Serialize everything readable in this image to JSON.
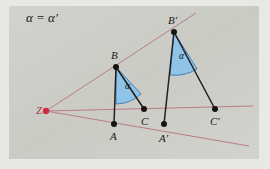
{
  "figure": {
    "title": "α = α′",
    "background_color": "#cdcdc8",
    "frame_color": "#e8e8e4",
    "ray_color": "#b5737d",
    "segment_color": "#1f1f1d",
    "angle_fill_color": "#8fc4e8",
    "angle_stroke_color": "#2f6fa8",
    "center_color": "#d42b3c",
    "vertex_color": "#141412"
  },
  "points": {
    "Z": {
      "label": "Z",
      "x": 46,
      "y": 111
    },
    "A": {
      "label": "A",
      "x": 114,
      "y": 124
    },
    "B": {
      "label": "B",
      "x": 116,
      "y": 67
    },
    "C": {
      "label": "C",
      "x": 144,
      "y": 109
    },
    "Aprime": {
      "label": "A′",
      "x": 164,
      "y": 124
    },
    "Bprime": {
      "label": "B′",
      "x": 174,
      "y": 32
    },
    "Cprime": {
      "label": "C′",
      "x": 215,
      "y": 109
    }
  },
  "point_labels": {
    "Z": {
      "text": "Z",
      "x": 36,
      "y": 114
    },
    "A": {
      "text": "A",
      "x": 110,
      "y": 140
    },
    "B": {
      "text": "B",
      "x": 111,
      "y": 59
    },
    "C": {
      "text": "C",
      "x": 141,
      "y": 125
    },
    "Aprime": {
      "text": "A′",
      "x": 159,
      "y": 142
    },
    "Bprime": {
      "text": "B′",
      "x": 168,
      "y": 24
    },
    "Cprime": {
      "text": "C′",
      "x": 210,
      "y": 125
    }
  },
  "angle_labels": {
    "alpha": {
      "text": "α",
      "x": 125,
      "y": 89
    },
    "alpha_prime": {
      "text": "α′",
      "x": 179,
      "y": 59
    }
  },
  "rays": [
    {
      "name": "ray-Z-through-B-Bprime",
      "x1": 46,
      "y1": 111,
      "x2": 196,
      "y2": 13
    },
    {
      "name": "ray-Z-through-C-Cprime",
      "x1": 46,
      "y1": 111,
      "x2": 253,
      "y2": 106
    },
    {
      "name": "ray-Z-through-A-Aprime",
      "x1": 46,
      "y1": 111,
      "x2": 249,
      "y2": 146
    }
  ],
  "segments": [
    {
      "name": "segment-AB",
      "x1": 114,
      "y1": 124,
      "x2": 116,
      "y2": 67
    },
    {
      "name": "segment-BC",
      "x1": 116,
      "y1": 67,
      "x2": 144,
      "y2": 109
    },
    {
      "name": "segment-ApBp",
      "x1": 164,
      "y1": 124,
      "x2": 174,
      "y2": 32
    },
    {
      "name": "segment-BpCp",
      "x1": 174,
      "y1": 32,
      "x2": 215,
      "y2": 109
    }
  ],
  "angle_sectors": [
    {
      "name": "angle-sector-alpha",
      "path": "M 116 67 L 116 104 A 37 37 0 0 0 141 94 Z"
    },
    {
      "name": "angle-sector-alpha-prime",
      "path": "M 174 32 L 170 75 A 43 43 0 0 0 197 69 Z"
    }
  ],
  "title_position": {
    "x": 26,
    "y": 22
  }
}
